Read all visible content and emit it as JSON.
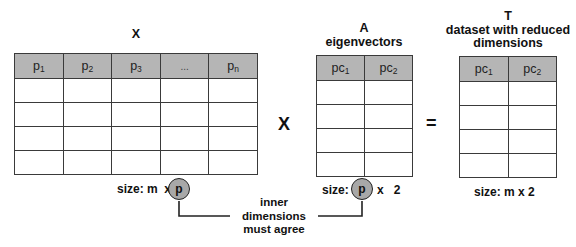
{
  "matrices": {
    "x": {
      "title": "X",
      "headers": [
        {
          "base": "p",
          "sub": "1"
        },
        {
          "base": "p",
          "sub": "2"
        },
        {
          "base": "p",
          "sub": "3"
        },
        {
          "base": "...",
          "sub": ""
        },
        {
          "base": "p",
          "sub": "n"
        }
      ],
      "rows": 4,
      "size_label": "size: m  x",
      "highlight_dim": "p"
    },
    "a": {
      "title_line1": "A",
      "title_line2": "eigenvectors",
      "headers": [
        {
          "base": "pc",
          "sub": "1"
        },
        {
          "base": "pc",
          "sub": "2"
        }
      ],
      "rows": 4,
      "size_prefix": "size:",
      "highlight_dim": "p",
      "size_suffix": "x   2"
    },
    "t": {
      "title_line1": "T",
      "title_line2": "dataset with reduced",
      "title_line3": "dimensions",
      "headers": [
        {
          "base": "pc",
          "sub": "1"
        },
        {
          "base": "pc",
          "sub": "2"
        }
      ],
      "rows": 4,
      "size_label": "size: m x 2"
    }
  },
  "operators": {
    "multiply": "X",
    "equals": "="
  },
  "annotation": {
    "line1": "inner",
    "line2": "dimensions",
    "line3": "must agree"
  },
  "colors": {
    "header_fill": "#b5b5b5",
    "circle_fill": "#a8a8a8",
    "border": "#3a3a3a"
  }
}
